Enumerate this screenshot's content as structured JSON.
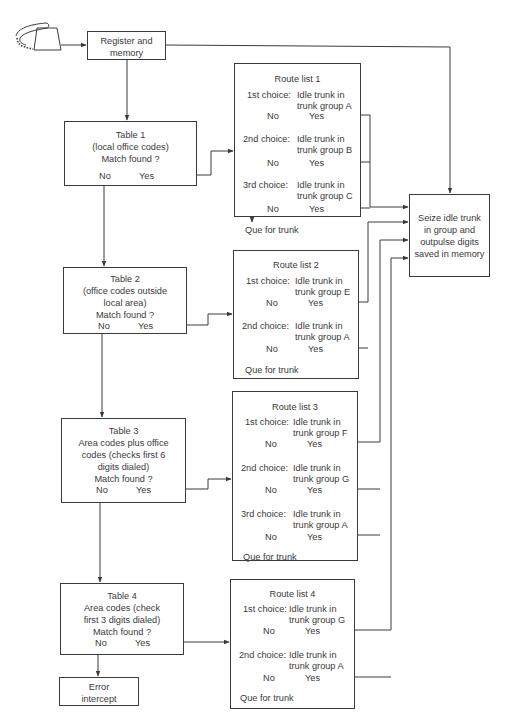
{
  "diagram": {
    "start_icon": "telephone-icon",
    "register": {
      "line1": "Register and",
      "line2": "memory"
    },
    "seize": {
      "lines": [
        "Seize idle trunk",
        "in group and",
        "outpulse digits",
        "saved in memory"
      ]
    },
    "error": {
      "line1": "Error",
      "line2": "intercept"
    },
    "tables": [
      {
        "lines": [
          "Table 1",
          "(local office codes)",
          "Match found ?"
        ],
        "no": "No",
        "yes": "Yes"
      },
      {
        "lines": [
          "Table 2",
          "(office codes outside",
          "local area)",
          "Match found ?"
        ],
        "no": "No",
        "yes": "Yes"
      },
      {
        "lines": [
          "Table 3",
          "Area codes plus office",
          "codes (checks first 6",
          "digits dialed)",
          "Match found ?"
        ],
        "no": "No",
        "yes": "Yes"
      },
      {
        "lines": [
          "Table 4",
          "Area codes (check",
          "first 3 digits dialed)",
          "Match found ?"
        ],
        "no": "No",
        "yes": "Yes"
      }
    ],
    "route_lists": [
      {
        "title": "Route list 1",
        "choices": [
          {
            "label": "1st choice:",
            "line1": "Idle trunk in",
            "line2": "trunk group A",
            "no": "No",
            "yes": "Yes"
          },
          {
            "label": "2nd choice:",
            "line1": "Idle trunk in",
            "line2": "trunk group B",
            "no": "No",
            "yes": "Yes"
          },
          {
            "label": "3rd choice:",
            "line1": "Idle trunk in",
            "line2": "trunk group C",
            "no": "No",
            "yes": "Yes"
          }
        ],
        "fallback": "Que for trunk"
      },
      {
        "title": "Route list 2",
        "choices": [
          {
            "label": "1st choice:",
            "line1": "Idle trunk in",
            "line2": "trunk group E",
            "no": "No",
            "yes": "Yes"
          },
          {
            "label": "2nd choice:",
            "line1": "Idle trunk in",
            "line2": "trunk group A",
            "no": "No",
            "yes": "Yes"
          }
        ],
        "fallback": "Que for trunk"
      },
      {
        "title": "Route list 3",
        "choices": [
          {
            "label": "1st choice:",
            "line1": "Idle trunk in",
            "line2": "trunk group F",
            "no": "No",
            "yes": "Yes"
          },
          {
            "label": "2nd choice:",
            "line1": "Idle trunk in",
            "line2": "trunk group G",
            "no": "No",
            "yes": "Yes"
          },
          {
            "label": "3rd choice:",
            "line1": "Idle trunk in",
            "line2": "trunk group A",
            "no": "No",
            "yes": "Yes"
          }
        ],
        "fallback": "Que for trunk"
      },
      {
        "title": "Route list 4",
        "choices": [
          {
            "label": "1st choice:",
            "line1": "Idle trunk in",
            "line2": "trunk group G",
            "no": "No",
            "yes": "Yes"
          },
          {
            "label": "2nd choice:",
            "line1": "Idle trunk in",
            "line2": "trunk group A",
            "no": "No",
            "yes": "Yes"
          }
        ],
        "fallback": "Que for trunk"
      }
    ]
  }
}
